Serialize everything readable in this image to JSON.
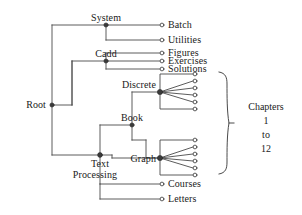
{
  "diagram": {
    "type": "tree-hierarchy",
    "stroke_color": "#4a4a4a",
    "text_color": "#1a1a1a",
    "background_color": "#ffffff",
    "internal_node_style": "filled-dot",
    "leaf_node_style": "open-circle",
    "nodes": {
      "root": {
        "label": "Root",
        "x": 52,
        "y": 105,
        "kind": "internal"
      },
      "system": {
        "label": "System",
        "x": 106,
        "y": 25,
        "kind": "internal"
      },
      "cadd": {
        "label": "Cadd",
        "x": 106,
        "y": 61,
        "kind": "internal"
      },
      "text_processing": {
        "label": "Text\nProcessing",
        "x": 100,
        "y": 155,
        "kind": "internal"
      },
      "book": {
        "label": "Book",
        "x": 132,
        "y": 125,
        "kind": "internal"
      },
      "discrete": {
        "label": "Discrete",
        "x": 160,
        "y": 92,
        "kind": "internal"
      },
      "graph": {
        "label": "Graph",
        "x": 160,
        "y": 158,
        "kind": "internal"
      }
    },
    "leaf_labels": {
      "batch": "Batch",
      "utilities": "Utilities",
      "figures": "Figures",
      "exercises": "Exercises",
      "solutions": "Solutions",
      "courses": "Courses",
      "letters": "Letters"
    },
    "node_labels": {
      "root": "Root",
      "system": "System",
      "cadd": "Cadd",
      "text_line1": "Text",
      "text_line2": "Processing",
      "book": "Book",
      "discrete": "Discrete",
      "graph": "Graph"
    },
    "brace": {
      "line1": "Chapters",
      "line2": "1",
      "line3": "to",
      "line4": "12",
      "spans_groups": [
        "discrete-chapters",
        "graph-chapters"
      ]
    },
    "chapter_groups": [
      {
        "parent": "discrete",
        "count": 6,
        "label": "Chapters 1 to 6"
      },
      {
        "parent": "graph",
        "count": 6,
        "label": "Chapters 7 to 12"
      }
    ],
    "edges": [
      {
        "from": "root",
        "to": "system"
      },
      {
        "from": "root",
        "to": "cadd"
      },
      {
        "from": "root",
        "to": "text_processing"
      },
      {
        "from": "system",
        "to": "batch"
      },
      {
        "from": "system",
        "to": "utilities"
      },
      {
        "from": "cadd",
        "to": "figures"
      },
      {
        "from": "cadd",
        "to": "exercises"
      },
      {
        "from": "cadd",
        "to": "solutions"
      },
      {
        "from": "text_processing",
        "to": "book"
      },
      {
        "from": "text_processing",
        "to": "graph"
      },
      {
        "from": "text_processing",
        "to": "courses"
      },
      {
        "from": "text_processing",
        "to": "letters"
      },
      {
        "from": "book",
        "to": "discrete"
      },
      {
        "from": "book",
        "to": "graph"
      }
    ]
  }
}
